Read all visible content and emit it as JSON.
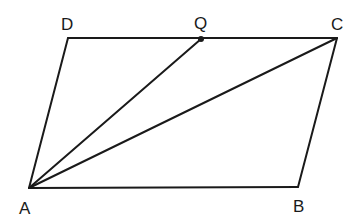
{
  "diagram": {
    "type": "parallelogram",
    "points": {
      "A": {
        "label": "A",
        "x": 29,
        "y": 188,
        "lx": 19,
        "ly": 214
      },
      "B": {
        "label": "B",
        "x": 298,
        "y": 187,
        "lx": 293,
        "ly": 212
      },
      "C": {
        "label": "C",
        "x": 337,
        "y": 38,
        "lx": 331,
        "ly": 30
      },
      "D": {
        "label": "D",
        "x": 68,
        "y": 38,
        "lx": 61,
        "ly": 30
      },
      "Q": {
        "label": "Q",
        "x": 201,
        "y": 39,
        "lx": 194,
        "ly": 29
      }
    },
    "segments": [
      "AB",
      "BC",
      "CD",
      "DA",
      "AQ",
      "AC"
    ],
    "stroke_color": "#1a1a1a"
  }
}
